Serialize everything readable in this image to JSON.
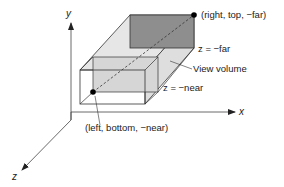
{
  "diagram": {
    "axes": {
      "x_label": "x",
      "y_label": "y",
      "z_label": "z"
    },
    "labels": {
      "far_corner": "(right, top, −far)",
      "near_corner": "(left, bottom, −near)",
      "far_plane": "z = −far",
      "near_plane": "z = −near",
      "volume": "View volume"
    },
    "colors": {
      "far_face": "#8c8c8c",
      "side_face": "#d9d9d9",
      "top_face": "#e3e3e3",
      "inner_face": "#dcdcdc",
      "line": "#333333",
      "point": "#000000"
    }
  }
}
